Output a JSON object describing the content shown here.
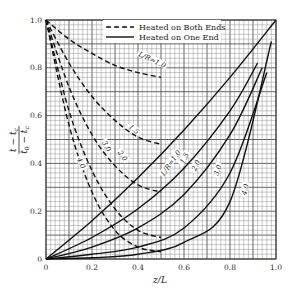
{
  "chart_data": {
    "type": "line",
    "title": "",
    "xlabel": "z/L",
    "ylabel": "(t − t_c) / (t_0 − t_c)",
    "xlim": [
      0,
      1.0
    ],
    "ylim": [
      0,
      1.0
    ],
    "xticks": [
      "0",
      "0.2",
      "0.4",
      "0.6",
      "0.8",
      "1.0"
    ],
    "yticks": [
      "0",
      "0.2",
      "0.4",
      "0.6",
      "0.8",
      "1.0"
    ],
    "grid": {
      "on": true,
      "minor_step": 0.02,
      "major_step": 0.1
    },
    "legend": {
      "position": "upper-right",
      "entries": [
        {
          "label": "Heated on Both Ends",
          "style": "dashed"
        },
        {
          "label": "Heated on One End",
          "style": "solid"
        }
      ]
    },
    "series": [
      {
        "name": "Heated on Both Ends, L/R=1.0",
        "style": "dashed",
        "label": "L/R=1.0",
        "x": [
          0,
          0.1,
          0.2,
          0.3,
          0.4,
          0.5
        ],
        "y": [
          1.0,
          0.92,
          0.86,
          0.81,
          0.78,
          0.76
        ]
      },
      {
        "name": "Heated on Both Ends, L/R=1.5",
        "style": "dashed",
        "label": "1.5",
        "x": [
          0,
          0.1,
          0.2,
          0.3,
          0.4,
          0.5
        ],
        "y": [
          1.0,
          0.82,
          0.68,
          0.58,
          0.51,
          0.48
        ]
      },
      {
        "name": "Heated on Both Ends, L/R=2.0",
        "style": "dashed",
        "label": "2.0",
        "x": [
          0,
          0.1,
          0.2,
          0.3,
          0.4,
          0.5
        ],
        "y": [
          1.0,
          0.72,
          0.52,
          0.39,
          0.31,
          0.28
        ]
      },
      {
        "name": "Heated on Both Ends, L/R=3.0",
        "style": "dashed",
        "label": "3.0",
        "x": [
          0,
          0.1,
          0.2,
          0.3,
          0.4,
          0.5
        ],
        "y": [
          1.0,
          0.62,
          0.37,
          0.21,
          0.12,
          0.09
        ]
      },
      {
        "name": "Heated on Both Ends, L/R=4.0",
        "style": "dashed",
        "label": "4.0",
        "x": [
          0,
          0.1,
          0.2,
          0.3,
          0.4,
          0.5
        ],
        "y": [
          1.0,
          0.56,
          0.28,
          0.12,
          0.05,
          0.03
        ]
      },
      {
        "name": "Heated on One End, L/R=1.0",
        "style": "solid",
        "label": "L/R=1.0",
        "x": [
          0,
          0.2,
          0.4,
          0.6,
          0.8,
          1.0
        ],
        "y": [
          0,
          0.16,
          0.34,
          0.54,
          0.76,
          1.0
        ]
      },
      {
        "name": "Heated on One End, L/R=1.5",
        "style": "solid",
        "label": "1.5",
        "x": [
          0,
          0.2,
          0.4,
          0.6,
          0.8,
          0.92
        ],
        "y": [
          0,
          0.09,
          0.21,
          0.38,
          0.62,
          0.82
        ]
      },
      {
        "name": "Heated on One End, L/R=2.0",
        "style": "solid",
        "label": "2.0",
        "x": [
          0,
          0.2,
          0.4,
          0.6,
          0.8,
          0.94
        ],
        "y": [
          0,
          0.05,
          0.13,
          0.27,
          0.52,
          0.8
        ]
      },
      {
        "name": "Heated on One End, L/R=3.0",
        "style": "solid",
        "label": "3.0",
        "x": [
          0,
          0.2,
          0.4,
          0.6,
          0.8,
          0.96
        ],
        "y": [
          0,
          0.02,
          0.05,
          0.13,
          0.36,
          0.78
        ]
      },
      {
        "name": "Heated on One End, L/R=4.0",
        "style": "solid",
        "label": "4.0",
        "x": [
          0,
          0.2,
          0.4,
          0.6,
          0.8,
          0.98
        ],
        "y": [
          0,
          0.005,
          0.02,
          0.07,
          0.24,
          0.91
        ]
      }
    ]
  }
}
